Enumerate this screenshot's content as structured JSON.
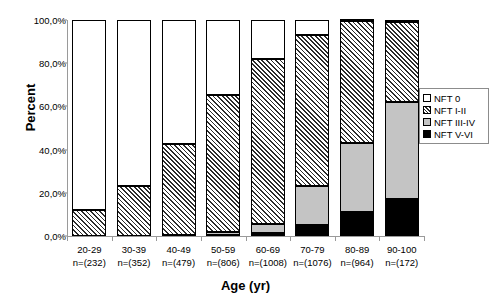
{
  "chart_data": {
    "type": "bar",
    "subtype": "stacked-100-percent",
    "title": "",
    "xlabel": "Age (yr)",
    "ylabel": "Percent",
    "ylim": [
      0,
      100
    ],
    "ytick_labels": [
      "0,0%",
      "20,0%",
      "40,0%",
      "60,0%",
      "80,0%",
      "100,0%"
    ],
    "ytick_values": [
      0,
      20,
      40,
      60,
      80,
      100
    ],
    "grid": false,
    "legend_position": "right",
    "categories": [
      "20-29",
      "30-39",
      "40-49",
      "50-59",
      "60-69",
      "70-79",
      "80-89",
      "90-100"
    ],
    "category_counts": [
      "n=(232)",
      "n=(352)",
      "n=(479)",
      "n=(806)",
      "n=(1008)",
      "n=(1076)",
      "n=(964)",
      "n=(172)"
    ],
    "series": [
      {
        "name": "NFT 0",
        "key": "nft0",
        "color": "#ffffff",
        "values": [
          88.0,
          77.0,
          57.5,
          34.5,
          18.0,
          7.0,
          0.5,
          1.0
        ]
      },
      {
        "name": "NFT I-II",
        "key": "nft12",
        "color": "#2b2b2b",
        "values": [
          12.0,
          23.0,
          42.0,
          63.5,
          76.5,
          70.0,
          56.5,
          37.0
        ]
      },
      {
        "name": "NFT III-IV",
        "key": "nft34",
        "color": "#c4c4c4",
        "values": [
          0.0,
          0.0,
          0.3,
          1.6,
          4.0,
          18.0,
          32.0,
          45.0
        ]
      },
      {
        "name": "NFT V-VI",
        "key": "nft56",
        "color": "#000000",
        "values": [
          0.0,
          0.0,
          0.2,
          0.4,
          1.5,
          5.0,
          11.0,
          17.0
        ]
      }
    ]
  },
  "legend": {
    "items": [
      {
        "label": "NFT 0",
        "key": "nft0"
      },
      {
        "label": "NFT I-II",
        "key": "nft12"
      },
      {
        "label": "NFT III-IV",
        "key": "nft34"
      },
      {
        "label": "NFT V-VI",
        "key": "nft56"
      }
    ]
  }
}
